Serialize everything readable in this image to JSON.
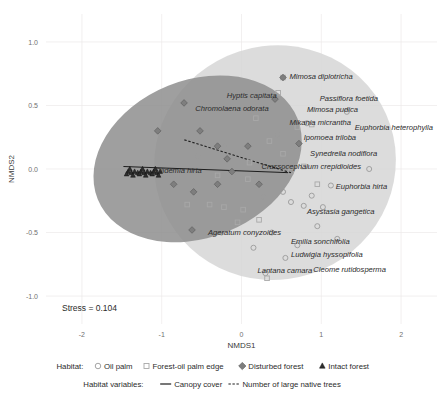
{
  "chart_data": {
    "type": "scatter",
    "title": "",
    "xlabel": "NMDS1",
    "ylabel": "NMDS2",
    "xlim": [
      -2.45,
      2.45
    ],
    "ylim": [
      -1.22,
      1.22
    ],
    "xticks": [
      "-2",
      "-1",
      "0",
      "1",
      "2"
    ],
    "xtick_values": [
      -2,
      -1,
      0,
      1,
      2
    ],
    "yticks": [
      "1.0",
      "0.5",
      "0.0",
      "-0.5",
      "-1.0"
    ],
    "ytick_values": [
      1.0,
      0.5,
      0.0,
      -0.5,
      -1.0
    ],
    "grid": true,
    "legend_position": "bottom",
    "stress_text": "Stress = 0.104",
    "series": [
      {
        "name": "Oil palm",
        "marker": "circle-open",
        "color": "#9a9a9a",
        "points": [
          [
            1.32,
            0.45
          ],
          [
            0.82,
            0.36
          ],
          [
            1.6,
            0.0
          ],
          [
            1.12,
            -0.13
          ],
          [
            0.52,
            -0.18
          ],
          [
            0.88,
            -0.21
          ],
          [
            0.78,
            -0.29
          ],
          [
            1.02,
            -0.3
          ],
          [
            0.62,
            -0.26
          ],
          [
            0.28,
            -0.22
          ],
          [
            -0.25,
            -0.5
          ],
          [
            0.38,
            -0.5
          ],
          [
            0.55,
            -0.7
          ],
          [
            0.3,
            -0.82
          ],
          [
            -0.55,
            0.1
          ],
          [
            -0.22,
            0.18
          ],
          [
            0.45,
            0.27
          ],
          [
            -0.1,
            -0.06
          ],
          [
            0.15,
            -0.62
          ],
          [
            0.7,
            -0.6
          ],
          [
            0.95,
            -0.45
          ],
          [
            1.2,
            -0.55
          ]
        ]
      },
      {
        "name": "Forest-oil palm edge",
        "marker": "square-open",
        "color": "#a8a8a8",
        "points": [
          [
            0.52,
            0.72
          ],
          [
            0.46,
            0.6
          ],
          [
            0.18,
            0.4
          ],
          [
            0.7,
            0.33
          ],
          [
            0.88,
            0.35
          ],
          [
            0.35,
            0.22
          ],
          [
            0.52,
            0.12
          ],
          [
            0.62,
            -0.02
          ],
          [
            0.08,
            -0.08
          ],
          [
            -0.3,
            -0.05
          ],
          [
            -0.22,
            -0.3
          ],
          [
            -0.4,
            -0.28
          ],
          [
            0.02,
            -0.32
          ],
          [
            0.22,
            -0.4
          ],
          [
            -0.05,
            -0.42
          ],
          [
            0.32,
            -0.86
          ],
          [
            -0.68,
            -0.28
          ],
          [
            0.78,
            0.02
          ],
          [
            0.95,
            -0.12
          ],
          [
            0.1,
            0.05
          ]
        ]
      },
      {
        "name": "Disturbed forest",
        "marker": "diamond-filled",
        "color": "#7e7e7e",
        "points": [
          [
            -0.72,
            0.52
          ],
          [
            -1.05,
            0.3
          ],
          [
            -0.52,
            0.3
          ],
          [
            -0.3,
            0.18
          ],
          [
            -0.18,
            0.08
          ],
          [
            -0.12,
            -0.02
          ],
          [
            -0.3,
            -0.12
          ],
          [
            -0.6,
            -0.18
          ],
          [
            -0.85,
            -0.12
          ],
          [
            -0.62,
            -0.48
          ],
          [
            0.08,
            0.18
          ],
          [
            0.42,
            0.55
          ],
          [
            0.52,
            0.72
          ],
          [
            0.72,
            0.2
          ],
          [
            0.22,
            -0.12
          ]
        ]
      },
      {
        "name": "Intact forest",
        "marker": "triangle-filled",
        "color": "#2e2e2e",
        "points": [
          [
            -1.42,
            -0.02
          ],
          [
            -1.38,
            -0.03
          ],
          [
            -1.34,
            -0.02
          ],
          [
            -1.3,
            -0.03
          ],
          [
            -1.26,
            -0.02
          ],
          [
            -1.22,
            -0.03
          ],
          [
            -1.18,
            -0.02
          ],
          [
            -1.14,
            -0.03
          ],
          [
            -1.1,
            -0.02
          ],
          [
            -1.06,
            -0.03
          ],
          [
            -1.02,
            -0.02
          ],
          [
            -1.44,
            -0.04
          ],
          [
            -1.36,
            -0.05
          ],
          [
            -1.28,
            -0.04
          ],
          [
            -1.2,
            -0.05
          ],
          [
            -1.12,
            -0.04
          ],
          [
            -1.04,
            -0.05
          ],
          [
            -1.4,
            0.0
          ],
          [
            -1.24,
            0.0
          ],
          [
            -1.08,
            0.0
          ]
        ]
      }
    ],
    "ellipses": [
      {
        "name": "light-ellipse",
        "fill": "#d6d6d6",
        "cx": 0.42,
        "cy": 0.05,
        "rx": 1.52,
        "ry": 0.92,
        "rotation": -18
      },
      {
        "name": "dark-ellipse",
        "fill": "#8e8e8e",
        "cx": -0.55,
        "cy": 0.08,
        "rx": 1.35,
        "ry": 0.62,
        "rotation": -22
      }
    ],
    "vectors": [
      {
        "name": "Canopy cover",
        "style": "solid",
        "x0": 0.62,
        "y0": -0.03,
        "x1": -1.48,
        "y1": 0.02
      },
      {
        "name": "Number of large native trees",
        "style": "dashed",
        "x0": 0.62,
        "y0": -0.03,
        "x1": -0.72,
        "y1": 0.23
      }
    ],
    "species_labels": [
      {
        "text": "Mimosa diplotricha",
        "x": 0.6,
        "y": 0.73,
        "anchor": "start"
      },
      {
        "text": "Hyptis capitata",
        "x": 0.44,
        "y": 0.58,
        "anchor": "end"
      },
      {
        "text": "Passiflora foetida",
        "x": 0.98,
        "y": 0.56,
        "anchor": "start"
      },
      {
        "text": "Chromolaena odorata",
        "x": -0.58,
        "y": 0.48,
        "anchor": "start"
      },
      {
        "text": "Mimosa pudica",
        "x": 0.82,
        "y": 0.47,
        "anchor": "start"
      },
      {
        "text": "Mikania micrantha",
        "x": 0.6,
        "y": 0.37,
        "anchor": "start"
      },
      {
        "text": "Euphorbia heterophylla",
        "x": 1.42,
        "y": 0.33,
        "anchor": "start"
      },
      {
        "text": "Ipomoea triloba",
        "x": 0.78,
        "y": 0.25,
        "anchor": "start"
      },
      {
        "text": "Synedrella nodiflora",
        "x": 0.86,
        "y": 0.12,
        "anchor": "start"
      },
      {
        "text": "Crassocephalum crepidioides",
        "x": 0.25,
        "y": 0.02,
        "anchor": "start"
      },
      {
        "text": "Clidemia hirta",
        "x": -1.08,
        "y": -0.01,
        "anchor": "start"
      },
      {
        "text": "Euphorbia hirta",
        "x": 1.18,
        "y": -0.14,
        "anchor": "start"
      },
      {
        "text": "Asystasia gangetica",
        "x": 0.82,
        "y": -0.33,
        "anchor": "start"
      },
      {
        "text": "Ageratum conyzoides",
        "x": -0.42,
        "y": -0.5,
        "anchor": "start"
      },
      {
        "text": "Emilia sonchifolia",
        "x": 0.62,
        "y": -0.57,
        "anchor": "start"
      },
      {
        "text": "Ludwigia hyssopifolia",
        "x": 0.62,
        "y": -0.67,
        "anchor": "start"
      },
      {
        "text": "Lantana camara",
        "x": 0.2,
        "y": -0.8,
        "anchor": "start"
      },
      {
        "text": "Cleome rutidosperma",
        "x": 0.9,
        "y": -0.79,
        "anchor": "start"
      }
    ]
  },
  "legend": {
    "habitat_label": "Habitat:",
    "items": [
      {
        "label": "Oil palm",
        "marker": "circle-open"
      },
      {
        "label": "Forest-oil palm edge",
        "marker": "square-open"
      },
      {
        "label": "Disturbed forest",
        "marker": "diamond-filled"
      },
      {
        "label": "Intact forest",
        "marker": "triangle-filled"
      }
    ],
    "variables_label": "Habitat variables:",
    "variables": [
      {
        "label": "Canopy cover",
        "line": "solid"
      },
      {
        "label": "Number of large native trees",
        "line": "dashed"
      }
    ]
  }
}
